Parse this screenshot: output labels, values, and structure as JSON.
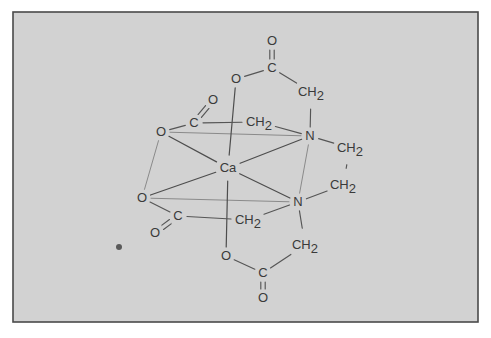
{
  "figure": {
    "background_color": "#d2d2d2",
    "page_color": "#ffffff",
    "border_color": "#4a4a4a",
    "bond_color": "#555555",
    "faint_bond_color": "#8a8a8a",
    "label_color": "#3a3a3a"
  },
  "frame": {
    "x": 13,
    "y": 12,
    "width": 465,
    "height": 310
  },
  "atoms": [
    {
      "id": "ca",
      "label": "Ca",
      "sub": "",
      "x": 228,
      "y": 168,
      "name": "atom-label-ca"
    },
    {
      "id": "n_top",
      "label": "N",
      "sub": "",
      "x": 310,
      "y": 136,
      "name": "atom-label-n-upper"
    },
    {
      "id": "n_bot",
      "label": "N",
      "sub": "",
      "x": 298,
      "y": 202,
      "name": "atom-label-n-lower"
    },
    {
      "id": "o1",
      "label": "O",
      "sub": "",
      "x": 236,
      "y": 79,
      "name": "atom-label-o-top-bridge"
    },
    {
      "id": "c1",
      "label": "C",
      "sub": "",
      "x": 272,
      "y": 68,
      "name": "atom-label-c-top-carboxyl"
    },
    {
      "id": "o1d",
      "label": "O",
      "sub": "",
      "x": 272,
      "y": 41,
      "name": "atom-label-o-top-carbonyl"
    },
    {
      "id": "ch2_1",
      "label": "CH",
      "sub": "2",
      "x": 311,
      "y": 92,
      "name": "atom-label-ch2-top-right"
    },
    {
      "id": "o2",
      "label": "O",
      "sub": "",
      "x": 161,
      "y": 132,
      "name": "atom-label-o-upper-left-bridge"
    },
    {
      "id": "c2",
      "label": "C",
      "sub": "",
      "x": 194,
      "y": 123,
      "name": "atom-label-c-upper-left-carboxyl"
    },
    {
      "id": "o2d",
      "label": "O",
      "sub": "",
      "x": 213,
      "y": 100,
      "name": "atom-label-o-upper-left-carbonyl"
    },
    {
      "id": "ch2_2",
      "label": "CH",
      "sub": "2",
      "x": 259,
      "y": 122,
      "name": "atom-label-ch2-upper-left"
    },
    {
      "id": "o3",
      "label": "O",
      "sub": "",
      "x": 142,
      "y": 198,
      "name": "atom-label-o-lower-left-bridge"
    },
    {
      "id": "c3",
      "label": "C",
      "sub": "",
      "x": 178,
      "y": 216,
      "name": "atom-label-c-lower-left-carboxyl"
    },
    {
      "id": "o3d",
      "label": "O",
      "sub": "",
      "x": 155,
      "y": 233,
      "name": "atom-label-o-lower-left-carbonyl"
    },
    {
      "id": "ch2_3",
      "label": "CH",
      "sub": "2",
      "x": 248,
      "y": 220,
      "name": "atom-label-ch2-lower-left"
    },
    {
      "id": "o4",
      "label": "O",
      "sub": "",
      "x": 226,
      "y": 256,
      "name": "atom-label-o-bottom-bridge"
    },
    {
      "id": "c4",
      "label": "C",
      "sub": "",
      "x": 263,
      "y": 273,
      "name": "atom-label-c-bottom-carboxyl"
    },
    {
      "id": "o4d",
      "label": "O",
      "sub": "",
      "x": 263,
      "y": 298,
      "name": "atom-label-o-bottom-carbonyl"
    },
    {
      "id": "ch2_4",
      "label": "CH",
      "sub": "2",
      "x": 305,
      "y": 245,
      "name": "atom-label-ch2-bottom-right"
    },
    {
      "id": "ch2_5",
      "label": "CH",
      "sub": "2",
      "x": 350,
      "y": 148,
      "name": "atom-label-ch2-bridge-upper"
    },
    {
      "id": "ch2_6",
      "label": "CH",
      "sub": "2",
      "x": 343,
      "y": 185,
      "name": "atom-label-ch2-bridge-lower"
    }
  ],
  "bonds": [
    {
      "from": "ca",
      "to": "o1",
      "style": "coord",
      "name": "bond-ca-o-top"
    },
    {
      "from": "ca",
      "to": "o2",
      "style": "coord",
      "name": "bond-ca-o-upper-left"
    },
    {
      "from": "ca",
      "to": "o3",
      "style": "coord",
      "name": "bond-ca-o-lower-left"
    },
    {
      "from": "ca",
      "to": "o4",
      "style": "coord",
      "name": "bond-ca-o-bottom"
    },
    {
      "from": "ca",
      "to": "n_top",
      "style": "coord",
      "name": "bond-ca-n-upper"
    },
    {
      "from": "ca",
      "to": "n_bot",
      "style": "coord",
      "name": "bond-ca-n-lower"
    },
    {
      "from": "o2",
      "to": "n_top",
      "style": "faint",
      "name": "bond-octahedron-edge-o2-n-top"
    },
    {
      "from": "o3",
      "to": "n_bot",
      "style": "faint",
      "name": "bond-octahedron-edge-o3-n-bot"
    },
    {
      "from": "o2",
      "to": "o3",
      "style": "faint",
      "name": "bond-octahedron-edge-o2-o3"
    },
    {
      "from": "n_top",
      "to": "n_bot",
      "style": "faint",
      "name": "bond-octahedron-edge-n-n"
    },
    {
      "from": "o1",
      "to": "c1",
      "style": "single",
      "name": "bond-o-c-top"
    },
    {
      "from": "c1",
      "to": "ch2_1",
      "style": "single",
      "name": "bond-c-ch2-top"
    },
    {
      "from": "ch2_1",
      "to": "n_top",
      "style": "single",
      "name": "bond-ch2-n-top"
    },
    {
      "from": "o2",
      "to": "c2",
      "style": "single",
      "name": "bond-o-c-upper-left"
    },
    {
      "from": "c2",
      "to": "ch2_2",
      "style": "single",
      "name": "bond-c-ch2-upper-left"
    },
    {
      "from": "ch2_2",
      "to": "n_top",
      "style": "single",
      "name": "bond-ch2-n-upper-left"
    },
    {
      "from": "o3",
      "to": "c3",
      "style": "single",
      "name": "bond-o-c-lower-left"
    },
    {
      "from": "c3",
      "to": "ch2_3",
      "style": "single",
      "name": "bond-c-ch2-lower-left"
    },
    {
      "from": "ch2_3",
      "to": "n_bot",
      "style": "single",
      "name": "bond-ch2-n-lower-left"
    },
    {
      "from": "o4",
      "to": "c4",
      "style": "single",
      "name": "bond-o-c-bottom"
    },
    {
      "from": "c4",
      "to": "ch2_4",
      "style": "single",
      "name": "bond-c-ch2-bottom"
    },
    {
      "from": "ch2_4",
      "to": "n_bot",
      "style": "single",
      "name": "bond-ch2-n-bottom"
    },
    {
      "from": "n_top",
      "to": "ch2_5",
      "style": "single",
      "name": "bond-n-ch2-bridge-upper"
    },
    {
      "from": "ch2_5",
      "to": "ch2_6",
      "style": "single",
      "name": "bond-ch2-ch2-bridge"
    },
    {
      "from": "ch2_6",
      "to": "n_bot",
      "style": "single",
      "name": "bond-ch2-n-bridge-lower"
    }
  ],
  "double_bonds": [
    {
      "from": "c1",
      "to": "o1d",
      "name": "double-bond-c-o-top"
    },
    {
      "from": "c2",
      "to": "o2d",
      "name": "double-bond-c-o-upper-left"
    },
    {
      "from": "c3",
      "to": "o3d",
      "name": "double-bond-c-o-lower-left"
    },
    {
      "from": "c4",
      "to": "o4d",
      "name": "double-bond-c-o-bottom"
    }
  ],
  "artifacts": [
    {
      "id": "speck",
      "x": 119,
      "y": 247,
      "r": 3,
      "name": "scan-speck-artifact"
    }
  ]
}
